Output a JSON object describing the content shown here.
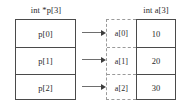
{
  "diagram": {
    "type": "c-pointer-array-to-int-array",
    "left_column": {
      "caption": "int *p[3]",
      "cells": [
        {
          "label": "p[0]"
        },
        {
          "label": "p[1]"
        },
        {
          "label": "p[2]"
        }
      ]
    },
    "right_column": {
      "caption": "int a[3]",
      "index_cells": [
        {
          "label": "a[0]"
        },
        {
          "label": "a[1]"
        },
        {
          "label": "a[2]"
        }
      ],
      "value_cells": [
        {
          "value": "10"
        },
        {
          "value": "20"
        },
        {
          "value": "30"
        }
      ]
    },
    "arrows": [
      {
        "name": "arrow-p0-to-a0"
      },
      {
        "name": "arrow-p1-to-a1"
      },
      {
        "name": "arrow-p2-to-a2"
      }
    ],
    "colors": {
      "background": "#ffffff",
      "solid_border": "#4a4a4a",
      "dashed_border": "#9a9a9a",
      "arrow": "#6e6e6e",
      "arrow_head": "#3d3d3d",
      "text": "#2b2b2b"
    }
  }
}
